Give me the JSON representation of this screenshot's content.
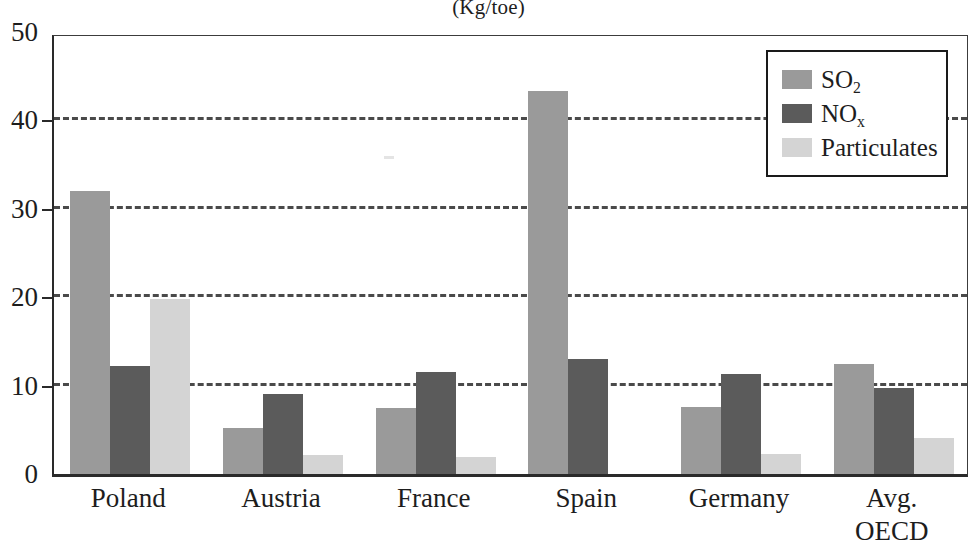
{
  "chart_data": {
    "type": "bar",
    "title": "(Kg/toe)",
    "xlabel": "",
    "ylabel": "",
    "ylim": [
      0,
      50
    ],
    "yticks": [
      0,
      10,
      20,
      30,
      40,
      50
    ],
    "gridlines": [
      10,
      20,
      30,
      40
    ],
    "grid": true,
    "grid_style": "dashed-horizontal",
    "legend_position": "top-right",
    "categories": [
      "Poland",
      "Austria",
      "France",
      "Spain",
      "Germany",
      "Avg. OECD"
    ],
    "category_lines": [
      [
        "Poland"
      ],
      [
        "Austria"
      ],
      [
        "France"
      ],
      [
        "Spain"
      ],
      [
        "Germany"
      ],
      [
        "Avg.",
        "OECD"
      ]
    ],
    "series": [
      {
        "name": "SO2",
        "label": "SO",
        "subscript": "2",
        "color": "#9a9a9a",
        "values": [
          32.0,
          5.2,
          7.5,
          43.3,
          7.6,
          12.5
        ]
      },
      {
        "name": "NOx",
        "label": "NO",
        "subscript": "x",
        "color": "#5b5b5b",
        "values": [
          12.2,
          9.0,
          11.5,
          13.0,
          11.3,
          9.7
        ]
      },
      {
        "name": "Particulates",
        "label": "Particulates",
        "subscript": "",
        "color": "#d4d4d4",
        "values": [
          19.8,
          2.2,
          1.9,
          0.0,
          2.3,
          4.1
        ]
      }
    ]
  },
  "legend": {
    "items": [
      {
        "label": "SO",
        "subscript": "2",
        "swatch": "so2"
      },
      {
        "label": "NO",
        "subscript": "x",
        "swatch": "nox"
      },
      {
        "label": "Particulates",
        "subscript": "",
        "swatch": "particulates"
      }
    ]
  },
  "axes": {
    "y_tick_labels": [
      "50",
      "40",
      "30",
      "20",
      "10",
      "0"
    ]
  }
}
